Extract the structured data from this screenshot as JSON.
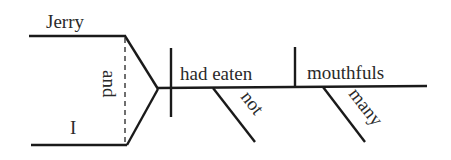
{
  "diagram": {
    "type": "Reed-Kellogg sentence diagram",
    "subjects": [
      {
        "word": "Jerry"
      },
      {
        "word": "I"
      }
    ],
    "conjunction": "and",
    "verb": "had eaten",
    "verb_modifier": "not",
    "direct_object": "mouthfuls",
    "object_modifier": "many"
  }
}
